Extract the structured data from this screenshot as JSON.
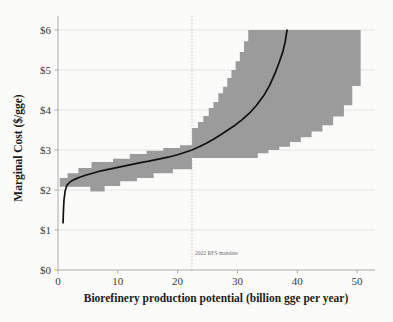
{
  "chart_data": {
    "type": "area",
    "title": "",
    "xlabel": "Biorefinery production potential (billion gge per year)",
    "ylabel": "Marginal Cost ($/gge)",
    "xlim": [
      0,
      53
    ],
    "ylim": [
      0,
      6.2
    ],
    "xticks": [
      0,
      10,
      20,
      30,
      40,
      50
    ],
    "xticklabels": [
      "0",
      "10",
      "20",
      "30",
      "40",
      "50"
    ],
    "yticks": [
      0,
      1,
      2,
      3,
      4,
      5,
      6
    ],
    "yticklabels": [
      "$0",
      "$1",
      "$2",
      "$3",
      "$4",
      "$5",
      "$6"
    ],
    "grid": true,
    "grid_axis": "y",
    "legend": "none",
    "band_color": "#9b9b9b",
    "line_color": "#111111",
    "annotations": [
      {
        "name": "2022-rfs-mandate",
        "label": "2022 RFS mandate",
        "x": 22.4,
        "style": "vertical-dotted-line",
        "label_y": 0.38,
        "color": "#b9b9b4"
      }
    ],
    "series": [
      {
        "name": "Uncertainty band (upper bound)",
        "type": "step",
        "x": [
          0.3,
          0.3,
          0.9,
          1.6,
          2.4,
          3.4,
          4.6,
          5.6,
          6.8,
          8.0,
          9.2,
          10.6,
          12.0,
          13.4,
          14.8,
          16.2,
          17.6,
          19.0,
          20.4,
          21.8,
          22.4,
          22.4,
          23.4,
          24.3,
          25.2,
          26.0,
          26.8,
          27.6,
          28.3,
          29.0,
          29.7,
          30.4,
          31.1,
          31.8,
          50.6
        ],
        "values": [
          1.15,
          2.3,
          2.3,
          2.42,
          2.42,
          2.55,
          2.55,
          2.7,
          2.7,
          2.7,
          2.78,
          2.78,
          2.9,
          2.9,
          2.98,
          2.98,
          3.05,
          3.05,
          3.12,
          3.12,
          3.28,
          3.55,
          3.7,
          3.85,
          4.05,
          4.2,
          4.42,
          4.58,
          4.8,
          5.0,
          5.22,
          5.45,
          5.72,
          6.0,
          6.0
        ]
      },
      {
        "name": "Uncertainty band (lower bound)",
        "type": "step",
        "x": [
          0.3,
          0.3,
          1.1,
          2.0,
          3.0,
          4.2,
          5.4,
          6.6,
          7.8,
          9.0,
          10.4,
          11.8,
          13.2,
          14.6,
          16.0,
          17.6,
          19.2,
          20.8,
          22.4,
          22.4,
          31.6,
          33.4,
          35.2,
          37.0,
          38.8,
          40.6,
          42.4,
          44.2,
          46.0,
          47.8,
          49.2,
          50.6
        ],
        "values": [
          1.15,
          2.08,
          2.08,
          2.08,
          2.08,
          2.08,
          1.96,
          1.96,
          2.1,
          2.1,
          2.22,
          2.22,
          2.3,
          2.3,
          2.42,
          2.42,
          2.52,
          2.52,
          2.6,
          2.8,
          2.8,
          2.92,
          3.0,
          3.08,
          3.2,
          3.32,
          3.46,
          3.62,
          3.84,
          4.12,
          4.6,
          4.98
        ]
      },
      {
        "name": "Marginal cost curve (median)",
        "type": "line",
        "x": [
          0.85,
          0.9,
          1.0,
          1.2,
          1.5,
          2.0,
          2.7,
          3.6,
          4.6,
          5.8,
          7.2,
          8.8,
          10.4,
          12.0,
          13.6,
          15.2,
          16.8,
          18.4,
          20.0,
          21.4,
          22.4,
          23.6,
          24.8,
          26.0,
          27.2,
          28.4,
          29.6,
          30.8,
          32.0,
          33.2,
          34.4,
          35.4,
          36.3,
          37.0,
          37.6,
          38.0,
          38.3
        ],
        "values": [
          1.18,
          1.45,
          1.75,
          1.98,
          2.12,
          2.2,
          2.26,
          2.32,
          2.37,
          2.42,
          2.48,
          2.53,
          2.58,
          2.63,
          2.68,
          2.72,
          2.77,
          2.82,
          2.88,
          2.95,
          3.0,
          3.08,
          3.17,
          3.27,
          3.38,
          3.5,
          3.62,
          3.76,
          3.92,
          4.12,
          4.36,
          4.62,
          4.92,
          5.2,
          5.46,
          5.72,
          6.0
        ]
      }
    ]
  }
}
